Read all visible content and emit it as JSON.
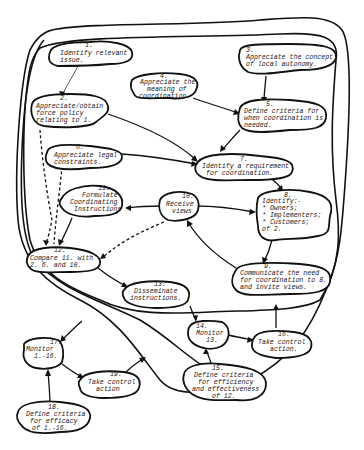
{
  "diagram": {
    "type": "cloud-flow-diagram",
    "nodes": [
      {
        "id": 1,
        "num": "1.",
        "lines": [
          "Identify relevant",
          "issue."
        ]
      },
      {
        "id": 2,
        "num": "2.",
        "lines": [
          "Appreciate/obtain",
          "force policy",
          "relating to 1."
        ]
      },
      {
        "id": 3,
        "num": "3.",
        "lines": [
          "Appreciate the concept",
          "of local autonomy."
        ]
      },
      {
        "id": 4,
        "num": "4.",
        "lines": [
          "Appreciate the",
          "meaning of",
          "coordination."
        ]
      },
      {
        "id": 5,
        "num": "5.",
        "lines": [
          "Define criteria for",
          "when coordination is",
          "needed."
        ]
      },
      {
        "id": 6,
        "num": "6.",
        "lines": [
          "Appreciate legal",
          "constraints."
        ]
      },
      {
        "id": 7,
        "num": "7.",
        "lines": [
          "Identify a requirement",
          "for coordination."
        ]
      },
      {
        "id": 8,
        "num": "8.",
        "lines": [
          "Identify:-",
          "* Owners;",
          "* Implementers;",
          "* Customers;",
          "of 2."
        ]
      },
      {
        "id": 9,
        "num": "9.",
        "lines": [
          "Communicate the need",
          "for coordination to 8.",
          "and invite views."
        ]
      },
      {
        "id": 10,
        "num": "10.",
        "lines": [
          "Receive",
          "views"
        ]
      },
      {
        "id": 11,
        "num": "11.",
        "lines": [
          "Formulate",
          "Coordinating",
          "Instructions"
        ]
      },
      {
        "id": 12,
        "num": "12.",
        "lines": [
          "Compare 11. with",
          "2. 6. and 10."
        ]
      },
      {
        "id": 13,
        "num": "13.",
        "lines": [
          "Disseminate",
          "instructions."
        ]
      },
      {
        "id": 14,
        "num": "14.",
        "lines": [
          "Monitor",
          "13."
        ]
      },
      {
        "id": 15,
        "num": "15.",
        "lines": [
          "Define criteria",
          "for efficiency",
          "and effectiveness",
          "of 12."
        ]
      },
      {
        "id": 16,
        "num": "16.",
        "lines": [
          "Take control",
          "action."
        ]
      },
      {
        "id": 17,
        "num": "17.",
        "lines": [
          "Monitor",
          "1.-16."
        ]
      },
      {
        "id": 18,
        "num": "18.",
        "lines": [
          "Define criteria",
          "for efficacy",
          "of 1.-16."
        ]
      },
      {
        "id": 19,
        "num": "19.",
        "lines": [
          "Take control",
          "action"
        ]
      }
    ],
    "edges": [
      {
        "from": 1,
        "to": 2,
        "style": "thin"
      },
      {
        "from": 3,
        "to": 5,
        "style": "solid"
      },
      {
        "from": 4,
        "to": 5,
        "style": "solid"
      },
      {
        "from": 2,
        "to": 7,
        "style": "solid"
      },
      {
        "from": 5,
        "to": 7,
        "style": "solid"
      },
      {
        "from": 6,
        "to": 7,
        "style": "solid"
      },
      {
        "from": 7,
        "to": 8,
        "style": "solid"
      },
      {
        "from": 8,
        "to": 9,
        "style": "solid"
      },
      {
        "from": 9,
        "to": 10,
        "style": "solid"
      },
      {
        "from": 10,
        "to": 8,
        "style": "solid"
      },
      {
        "from": 10,
        "to": 11,
        "style": "solid"
      },
      {
        "from": 11,
        "to": 12,
        "style": "solid"
      },
      {
        "from": 2,
        "to": 12,
        "style": "dashed"
      },
      {
        "from": 6,
        "to": 12,
        "style": "dashed"
      },
      {
        "from": 10,
        "to": 12,
        "style": "dashed"
      },
      {
        "from": 12,
        "to": 13,
        "style": "solid"
      },
      {
        "from": 13,
        "to": 14,
        "style": "solid"
      },
      {
        "from": 14,
        "to": 16,
        "style": "solid"
      },
      {
        "from": 15,
        "to": 14,
        "style": "solid"
      },
      {
        "from": 16,
        "to": "inner-boundary",
        "style": "solid"
      },
      {
        "from": "outer-boundary",
        "to": 17,
        "style": "solid"
      },
      {
        "from": 17,
        "to": 19,
        "style": "solid"
      },
      {
        "from": 18,
        "to": 17,
        "style": "solid"
      },
      {
        "from": 19,
        "to": "outer-boundary",
        "style": "solid"
      }
    ]
  }
}
